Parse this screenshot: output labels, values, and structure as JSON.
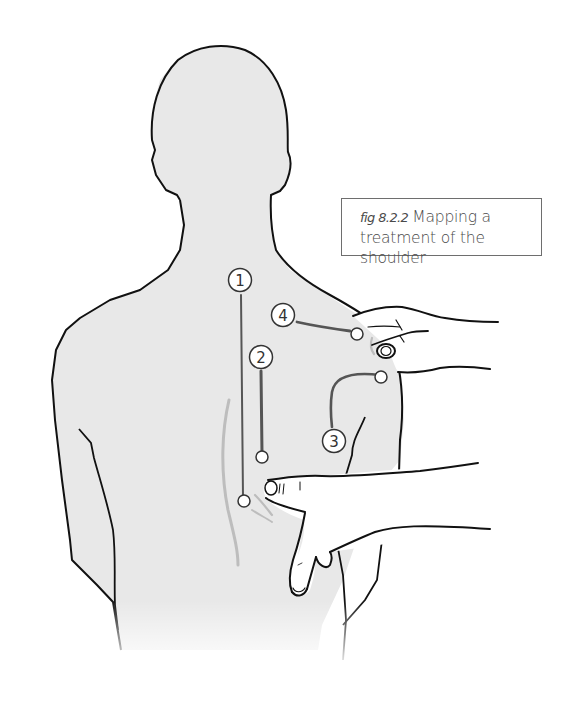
{
  "figure": {
    "title": "Mapping a treatment of the shoulder",
    "caption": {
      "figure_number": "fig 8.2.2",
      "line1": "Mapping a",
      "line2": "treatment of the shoulder"
    },
    "colors": {
      "body_fill": "#e8e8e8",
      "outline": "#111111",
      "guide_line": "#555555",
      "soft_line": "#bdbdbd",
      "caption_border": "#6e6e6e",
      "caption_text": "#4a4a4a"
    },
    "markers": [
      {
        "id": 1,
        "label": "1"
      },
      {
        "id": 2,
        "label": "2"
      },
      {
        "id": 3,
        "label": "3"
      },
      {
        "id": 4,
        "label": "4"
      }
    ],
    "hands": [
      {
        "name": "upper hand",
        "position": "holding right shoulder"
      },
      {
        "name": "lower hand",
        "position": "pointing finger on mid back"
      }
    ]
  }
}
